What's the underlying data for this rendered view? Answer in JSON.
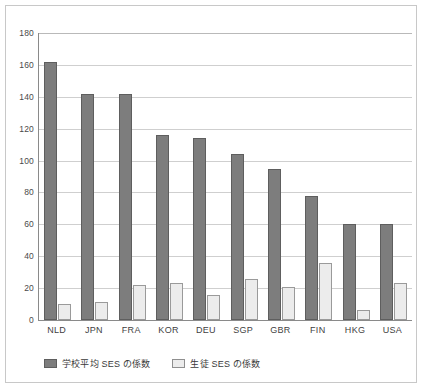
{
  "chart_data": {
    "type": "bar",
    "title": "",
    "subtitle": "",
    "xlabel": "",
    "ylabel": "",
    "categories": [
      "NLD",
      "JPN",
      "FRA",
      "KOR",
      "DEU",
      "SGP",
      "GBR",
      "FIN",
      "HKG",
      "USA"
    ],
    "series": [
      {
        "name": "学校平均 SES の係数",
        "color": "#7d7d7d",
        "values": [
          162,
          142,
          142,
          116,
          114,
          104,
          95,
          78,
          60,
          60
        ]
      },
      {
        "name": "生徒 SES の係数",
        "color": "#ececec",
        "values": [
          10,
          11,
          22,
          23,
          16,
          26,
          21,
          36,
          6,
          23
        ]
      }
    ],
    "ylim": [
      0,
      180
    ],
    "ytick_step": 20,
    "yticks": [
      0,
      20,
      40,
      60,
      80,
      100,
      120,
      140,
      160,
      180
    ],
    "ytick_labels": [
      "0",
      "20",
      "40",
      "60",
      "80",
      "100",
      "120",
      "140",
      "160",
      "180"
    ],
    "grid": true,
    "grid_axis": "y",
    "legend_position": "bottom-left",
    "annotations": []
  },
  "legend": {
    "items": [
      {
        "label": "学校平均 SES の係数",
        "swatch": "filled-dark-square"
      },
      {
        "label": "生徒 SES の係数",
        "swatch": "outlined-light-square"
      }
    ]
  }
}
